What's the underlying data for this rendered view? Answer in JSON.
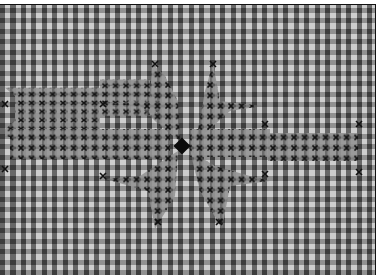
{
  "image": {
    "description": "Black-and-white photograph of gingham check fabric with a cross-stitch embroidered star/snowflake motif in the center",
    "colors": {
      "dark_check": "#3a3a3a",
      "light_check": "#f0f0f0",
      "mid_check": "#8c8c8c",
      "stitch": "#1a1a1a",
      "frame": "#111111"
    },
    "motif": {
      "type": "eight-point cross-stitch star",
      "center": [
        182,
        145
      ],
      "center_knot": "dark filled square"
    }
  }
}
